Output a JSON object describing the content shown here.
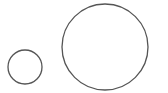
{
  "canvas": {
    "width": 168,
    "height": 93,
    "background": "#ffffff"
  },
  "shapes": [
    {
      "name": "small-circle",
      "cx": 25,
      "cy": 67,
      "r": 17,
      "stroke": "#555555",
      "stroke_width": 1.3,
      "fill": "none"
    },
    {
      "name": "large-circle",
      "cx": 105,
      "cy": 47,
      "r": 43,
      "stroke": "#555555",
      "stroke_width": 1.3,
      "fill": "none"
    }
  ]
}
